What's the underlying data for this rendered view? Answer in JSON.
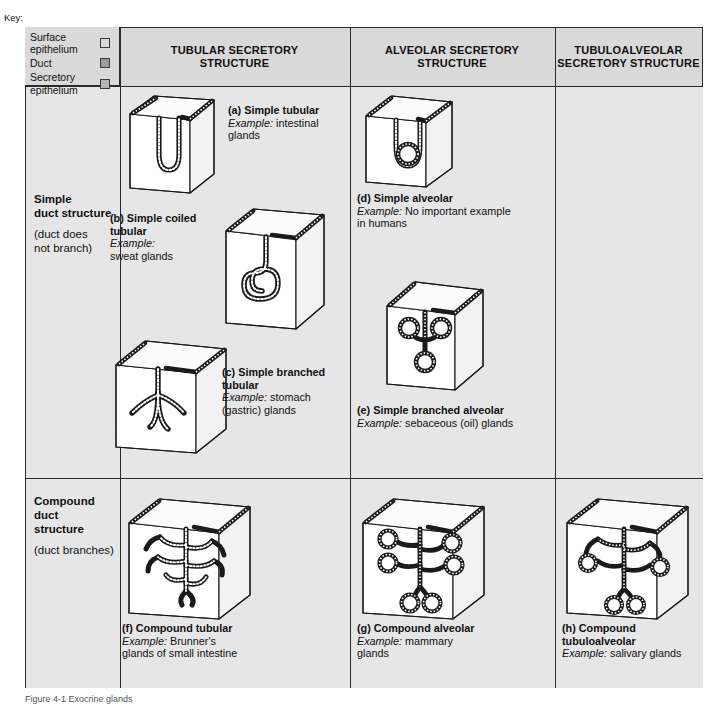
{
  "key": {
    "title": "Key:",
    "items": [
      {
        "label": "Surface\nepithelium",
        "swatch": "#d9d9d9",
        "name": "surface-epithelium"
      },
      {
        "label": "Duct",
        "swatch": "#9b9b9b",
        "name": "duct"
      },
      {
        "label": "Secretory\nepithelium",
        "swatch": "#b4b4b4",
        "name": "secretory-epithelium"
      }
    ]
  },
  "columns": [
    {
      "label": "TUBULAR SECRETORY STRUCTURE"
    },
    {
      "label": "ALVEOLAR SECRETORY STRUCTURE"
    },
    {
      "label": "TUBULOALVEOLAR SECRETORY STRUCTURE"
    }
  ],
  "rows": [
    {
      "title_lines": [
        "Simple",
        "duct structure"
      ],
      "note_lines": [
        "(duct does",
        "not branch)"
      ]
    },
    {
      "title_lines": [
        "Compound",
        "duct",
        "structure"
      ],
      "note_lines": [
        "(duct branches)"
      ]
    }
  ],
  "panels": {
    "a": {
      "title": "(a) Simple tubular",
      "example_label": "Example:",
      "example_text": " intestinal glands"
    },
    "b": {
      "title": "(b) Simple coiled tubular",
      "example_label": "Example:",
      "example_text": "sweat glands"
    },
    "c": {
      "title": "(c) Simple branched tubular",
      "example_label": "Example:",
      "example_text": " stomach (gastric) glands"
    },
    "d": {
      "title": "(d) Simple alveolar",
      "example_label": "Example:",
      "example_text": " No important example in humans"
    },
    "e": {
      "title": "(e) Simple branched alveolar",
      "example_label": "Example:",
      "example_text": " sebaceous (oil) glands"
    },
    "f": {
      "title": "(f) Compound tubular",
      "example_label": "Example:",
      "example_text": " Brunner's glands of small intestine"
    },
    "g": {
      "title": "(g) Compound alveolar",
      "example_label": "Example:",
      "example_text": " mammary glands"
    },
    "h": {
      "title": "(h) Compound tubuloalveolar",
      "example_label": "Example:",
      "example_text": " salivary glands"
    }
  },
  "figure_caption": "Figure 4-1  Exocrine glands",
  "colors": {
    "frame": "#2a2a2a",
    "header_bg": "#d9d9d9",
    "cell_bg": "#e6e6e6",
    "gland_outline": "#1a1a1a"
  }
}
